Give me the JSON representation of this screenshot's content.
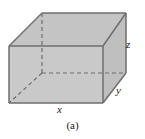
{
  "figure": {
    "caption": "(a)",
    "background_color": "#ffffff",
    "face_fill_color": "#c9c9c9",
    "top_face_fill_color": "#c4c4c4",
    "side_face_fill_color": "#bfbfbf",
    "edge_color": "#6e6e6e",
    "hidden_edge_color": "#6e6e6e",
    "edge_width": 1.4,
    "hidden_edge_dash": "4 3"
  },
  "labels": {
    "x": "x",
    "y": "y",
    "z": "z"
  },
  "geometry": {
    "front_top_left": [
      9,
      46
    ],
    "front_top_right": [
      103,
      46
    ],
    "front_bottom_left": [
      9,
      103
    ],
    "front_bottom_right": [
      103,
      103
    ],
    "back_top_left": [
      42,
      13
    ],
    "back_top_right": [
      126,
      13
    ],
    "back_bottom_left": [
      42,
      73
    ],
    "back_bottom_right": [
      126,
      73
    ]
  }
}
